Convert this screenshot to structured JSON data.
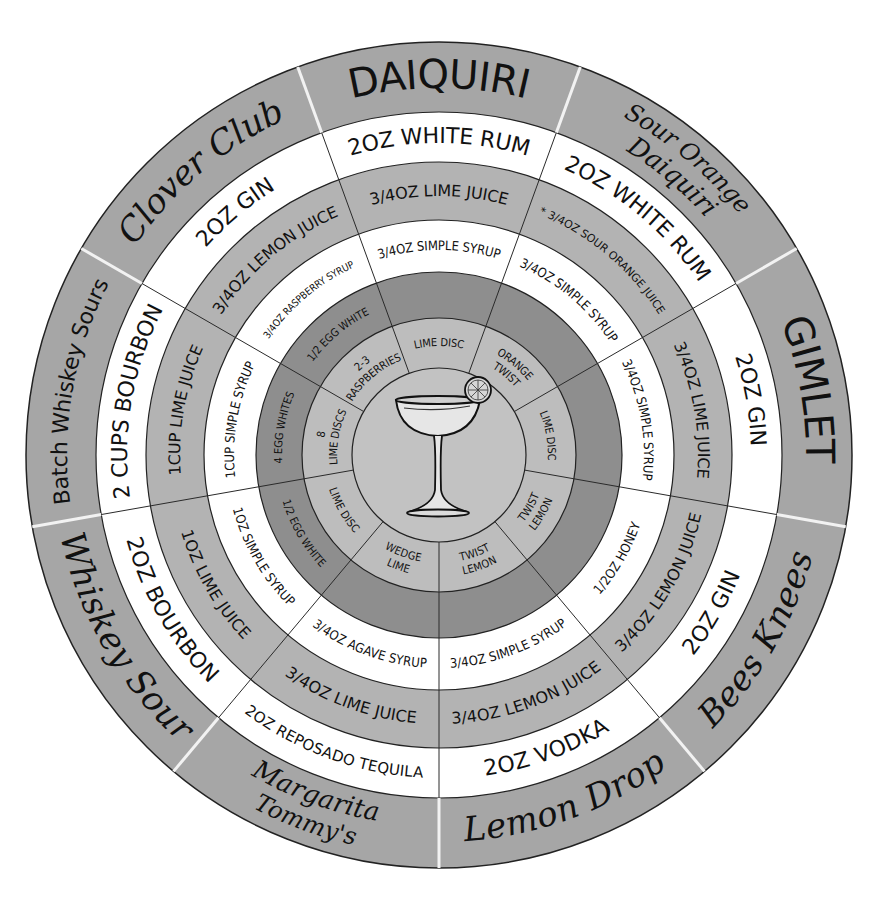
{
  "colors": {
    "background": "#ffffff",
    "name_ring": "#a6a6a6",
    "white_ring": "#ffffff",
    "light_gray_ring": "#b3b3b3",
    "dark_ring": "#8e8e8e",
    "garnish_ring": "#bdbdbd",
    "center": "#c2c2c2",
    "divider_line": "#2a2a2a",
    "name_divider": "#f2f2f2",
    "ink": "#111111"
  },
  "geometry": {
    "cx": 439,
    "cy": 455,
    "radii": [
      413,
      343,
      293,
      235,
      183,
      137,
      87
    ],
    "section_width_deg": 40,
    "start_angle_deg": -20
  },
  "center_icon": "coupe-glass-with-citrus-wheel-icon",
  "sections": [
    {
      "name": "DAIQUIRI",
      "name_style": "caps",
      "base_spirit": "2oz White Rum",
      "citrus": "3/4oz Lime Juice",
      "sweetener": "3/4oz Simple Syrup",
      "extra": "",
      "garnish": "Lime Disc"
    },
    {
      "name": "Sour Orange Daiquiri",
      "name_style": "script",
      "base_spirit": "2oz White Rum",
      "citrus": "* 3/4oz Sour Orange Juice",
      "sweetener": "3/4oz Simple Syrup",
      "extra": "",
      "garnish": "Orange Twist"
    },
    {
      "name": "GIMLET",
      "name_style": "caps",
      "base_spirit": "2oz Gin",
      "citrus": "3/4oz Lime Juice",
      "sweetener": "3/4oz Simple Syrup",
      "extra": "",
      "garnish": "Lime Disc"
    },
    {
      "name": "Bees Knees",
      "name_style": "script",
      "base_spirit": "2oz Gin",
      "citrus": "3/4oz Lemon Juice",
      "sweetener": "1/2oz Honey",
      "extra": "",
      "garnish": "Lemon Twist"
    },
    {
      "name": "Lemon Drop",
      "name_style": "script",
      "base_spirit": "2oz Vodka",
      "citrus": "3/4oz Lemon Juice",
      "sweetener": "3/4oz Simple Syrup",
      "extra": "",
      "garnish": "Lemon Twist"
    },
    {
      "name": "Tommy's Margarita",
      "name_style": "script",
      "base_spirit": "2oz Reposado Tequila",
      "citrus": "3/4oz Lime Juice",
      "sweetener": "3/4oz Agave Syrup",
      "extra": "",
      "garnish": "Lime Wedge"
    },
    {
      "name": "Whiskey Sour",
      "name_style": "script",
      "base_spirit": "2oz Bourbon",
      "citrus": "1oz Lime Juice",
      "sweetener": "1oz Simple Syrup",
      "extra": "1/2 Egg White",
      "garnish": "Lime Disc"
    },
    {
      "name": "Batch Whiskey Sours",
      "name_style": "caps",
      "base_spirit": "2 cups Bourbon",
      "citrus": "1cup Lime Juice",
      "sweetener": "1cup Simple Syrup",
      "extra": "4 Egg Whites",
      "garnish": "8 Lime Discs"
    },
    {
      "name": "Clover Club",
      "name_style": "script",
      "base_spirit": "2oz Gin",
      "citrus": "3/4oz Lemon Juice",
      "sweetener": "3/4oz Raspberry Syrup",
      "extra": "1/2 Egg White",
      "garnish": "2-3 Raspberries"
    }
  ],
  "ring_labels": [
    "cocktail name",
    "base spirit",
    "citrus",
    "sweetener",
    "extra",
    "garnish"
  ]
}
